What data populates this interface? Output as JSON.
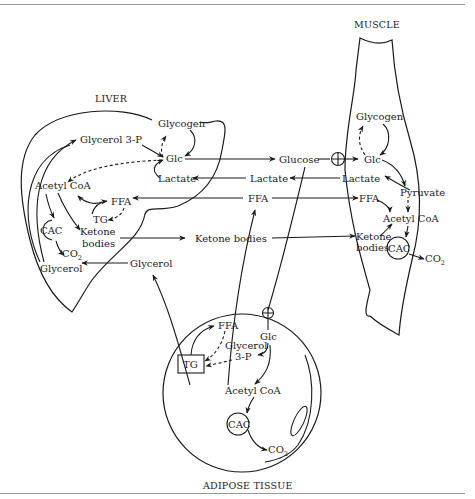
{
  "regions": {
    "liver": "LIVER",
    "muscle": "MUSCLE",
    "adipose": "ADIPOSE TISSUE"
  },
  "liver": {
    "glycogen": "Glycogen",
    "glycerol3p": "Glycerol 3-P",
    "glc": "Glc",
    "lactate": "Lactate",
    "acetyl_coa": "Acetyl CoA",
    "ffa": "FFA",
    "tg": "TG",
    "cac": "CAC",
    "ketone1": "Ketone",
    "ketone2": "bodies",
    "co2": "CO",
    "co2_sub": "2",
    "glycerol": "Glycerol"
  },
  "blood": {
    "glucose": "Glucose",
    "lactate": "Lactate",
    "ffa": "FFA",
    "ketone_bodies": "Ketone bodies",
    "glycerol": "Glycerol"
  },
  "muscle": {
    "glycogen": "Glycogen",
    "glc": "Glc",
    "lactate": "Lactate",
    "pyruvate": "Pyruvate",
    "ffa": "FFA",
    "acetyl_coa": "Acetyl CoA",
    "ketone1": "Ketone",
    "ketone2": "bodies",
    "cac": "CAC",
    "co2": "CO",
    "co2_sub": "2"
  },
  "adipose": {
    "ffa": "FFA",
    "glc": "Glc",
    "glycerol3p_1": "Glycerol",
    "glycerol3p_2": "3-P",
    "tg": "TG",
    "acetyl_coa": "Acetyl CoA",
    "cac": "CAC",
    "co2": "CO",
    "co2_sub": "2"
  },
  "symbols": {
    "insulin_transport": "circle-plus"
  }
}
